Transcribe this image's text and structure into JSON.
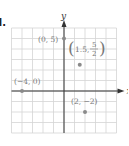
{
  "problem_label": "d.",
  "chart_data": {
    "type": "scatter",
    "title": "",
    "xlabel": "x",
    "ylabel": "y",
    "xlim": [
      -5,
      5
    ],
    "ylim": [
      -4,
      6
    ],
    "grid": true,
    "points": [
      {
        "x": 0,
        "y": 5,
        "label": "(0, 5)"
      },
      {
        "x": 1.5,
        "y": 2.5,
        "label": "(1.5, 5/2)"
      },
      {
        "x": -4,
        "y": 0,
        "label": "(−4, 0)"
      },
      {
        "x": 2,
        "y": -2,
        "label": "(2, −2)"
      }
    ]
  },
  "colors": {
    "grid": "#d4d4d4",
    "axis": "#333333",
    "point": "#8a8a8a",
    "label": "#777777"
  }
}
